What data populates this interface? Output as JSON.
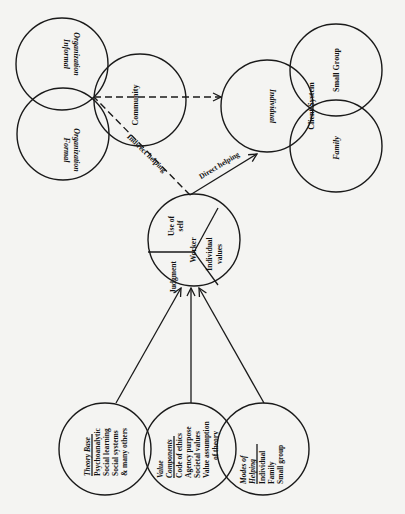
{
  "diagram": {
    "orientation": "rotated 90 degrees clockwise on page",
    "organization_cluster": {
      "circles": [
        {
          "id": "informal",
          "label_1": "Informal",
          "label_2": "Organization"
        },
        {
          "id": "formal",
          "label_1": "Formal",
          "label_2": "Organization"
        },
        {
          "id": "community",
          "label": "Community"
        }
      ]
    },
    "client_cluster": {
      "circles": [
        {
          "id": "individual",
          "label": "Individual"
        },
        {
          "id": "small_group",
          "label": "Small Group"
        },
        {
          "id": "family",
          "label": "Family"
        }
      ],
      "center_label": "Client System"
    },
    "worker": {
      "center_label": "Worker",
      "segments": [
        {
          "id": "use_of_self",
          "line_1": "Use of",
          "line_2": "self"
        },
        {
          "id": "individual_values",
          "line_1": "Individual",
          "line_2": "values"
        },
        {
          "id": "judgment",
          "label": "Judgment"
        }
      ]
    },
    "edges": {
      "indirect": "Indirect helping",
      "direct": "Direct helping"
    },
    "inputs": [
      {
        "id": "theory_base",
        "title": "Theory Base",
        "items": [
          "Psychoanalytic",
          "Social learning",
          "Social systems",
          "& many others"
        ]
      },
      {
        "id": "value_components",
        "title_1": "Value",
        "title_2": "Components",
        "items": [
          "Code of ethics",
          "Agency purpose",
          "Societal values",
          "Value assumption",
          "of theory"
        ]
      },
      {
        "id": "modes_of_helping",
        "title_1": "Modes of",
        "title_2": "Helping",
        "items": [
          "Individual",
          "Family",
          "Small group"
        ]
      }
    ]
  }
}
